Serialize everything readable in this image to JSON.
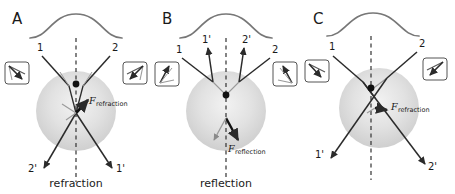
{
  "figure": {
    "background": "#ffffff",
    "width": 455,
    "height": 194,
    "ray_color": "#2b2b2b",
    "curve_color": "#777777",
    "sphere_color": "#d9d9d9",
    "axis_color": "#333333"
  },
  "panels": [
    {
      "letter": "A",
      "caption": "refraction",
      "beam_profile": "gaussian-curve",
      "incoming_rays": [
        {
          "label": "1",
          "side": "left"
        },
        {
          "label": "2",
          "side": "right"
        }
      ],
      "outgoing_rays": [
        {
          "label": "2'",
          "side": "left"
        },
        {
          "label": "1'",
          "side": "right"
        }
      ],
      "force": {
        "symbol": "F",
        "subscript": "refraction",
        "direction": "upward"
      },
      "insets": [
        {
          "side": "left",
          "name": "vector-diagram-left"
        },
        {
          "side": "right",
          "name": "vector-diagram-right"
        }
      ]
    },
    {
      "letter": "B",
      "caption": "reflection",
      "beam_profile": "gaussian-curve",
      "incoming_rays": [
        {
          "label": "1",
          "side": "left"
        },
        {
          "label": "2",
          "side": "right"
        }
      ],
      "outgoing_rays": [
        {
          "label": "1'",
          "side": "left"
        },
        {
          "label": "2'",
          "side": "right"
        }
      ],
      "force": {
        "symbol": "F",
        "subscript": "reflection",
        "direction": "downward"
      },
      "insets": [
        {
          "side": "left",
          "name": "vector-diagram-left"
        },
        {
          "side": "right",
          "name": "vector-diagram-right"
        }
      ]
    },
    {
      "letter": "C",
      "caption": "",
      "beam_profile": "gaussian-curve",
      "incoming_rays": [
        {
          "label": "1",
          "side": "left"
        },
        {
          "label": "2",
          "side": "right"
        }
      ],
      "outgoing_rays": [
        {
          "label": "1'",
          "side": "left"
        },
        {
          "label": "2'",
          "side": "right"
        }
      ],
      "force": {
        "symbol": "F",
        "subscript": "refraction",
        "direction": "lower-right"
      },
      "insets": [
        {
          "side": "left",
          "name": "vector-diagram-left"
        },
        {
          "side": "right",
          "name": "vector-diagram-right"
        }
      ]
    }
  ]
}
